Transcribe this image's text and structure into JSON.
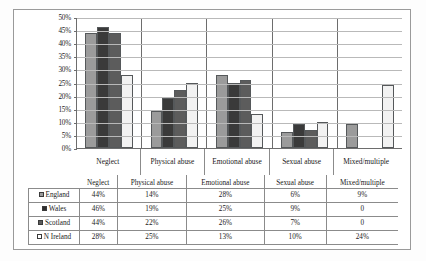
{
  "chart_data": {
    "type": "bar",
    "title": "",
    "xlabel": "",
    "ylabel": "",
    "ylim": [
      0,
      50
    ],
    "grid": true,
    "legend_position": "table-below",
    "categories": [
      "Neglect",
      "Physical abuse",
      "Emotional abuse",
      "Sexual abuse",
      "Mixed/multiple"
    ],
    "ytick_labels": [
      "50%",
      "45%",
      "40%",
      "35%",
      "30%",
      "25%",
      "20%",
      "15%",
      "10%",
      "5%",
      "0%"
    ],
    "ytick_values": [
      50,
      45,
      40,
      35,
      30,
      25,
      20,
      15,
      10,
      5,
      0
    ],
    "series": [
      {
        "name": "England",
        "swatch": "sw0",
        "bar": "s0",
        "values": [
          44,
          14,
          28,
          6,
          9
        ],
        "labels": [
          "44%",
          "14%",
          "28%",
          "6%",
          "9%"
        ]
      },
      {
        "name": "Wales",
        "swatch": "sw1",
        "bar": "s1",
        "values": [
          46,
          19,
          25,
          9,
          0
        ],
        "labels": [
          "46%",
          "19%",
          "25%",
          "9%",
          "0"
        ]
      },
      {
        "name": "Scotland",
        "swatch": "sw2",
        "bar": "s2",
        "values": [
          44,
          22,
          26,
          7,
          0
        ],
        "labels": [
          "44%",
          "22%",
          "26%",
          "7%",
          "0"
        ]
      },
      {
        "name": "N Ireland",
        "swatch": "sw3",
        "bar": "s3",
        "values": [
          28,
          25,
          13,
          10,
          24
        ],
        "labels": [
          "28%",
          "25%",
          "13%",
          "10%",
          "24%"
        ]
      }
    ],
    "colors": {
      "england": "#9b9b9b",
      "wales": "#3a3a3a",
      "scotland": "#5c5c5c",
      "n_ireland": "#f2f2f2",
      "gridline": "#b9b9b9",
      "axis": "#6d6d6d",
      "text": "#1a1a1a"
    }
  },
  "table": {
    "corner_label": "",
    "column_headers": [
      "Neglect",
      "Physical abuse",
      "Emotional abuse",
      "Sexual abuse",
      "Mixed/multiple"
    ],
    "rows": [
      {
        "label": "England",
        "cells": [
          "44%",
          "14%",
          "28%",
          "6%",
          "9%"
        ]
      },
      {
        "label": "Wales",
        "cells": [
          "46%",
          "19%",
          "25%",
          "9%",
          "0"
        ]
      },
      {
        "label": "Scotland",
        "cells": [
          "44%",
          "22%",
          "26%",
          "7%",
          "0"
        ]
      },
      {
        "label": "N Ireland",
        "cells": [
          "28%",
          "25%",
          "13%",
          "10%",
          "24%"
        ]
      }
    ]
  }
}
